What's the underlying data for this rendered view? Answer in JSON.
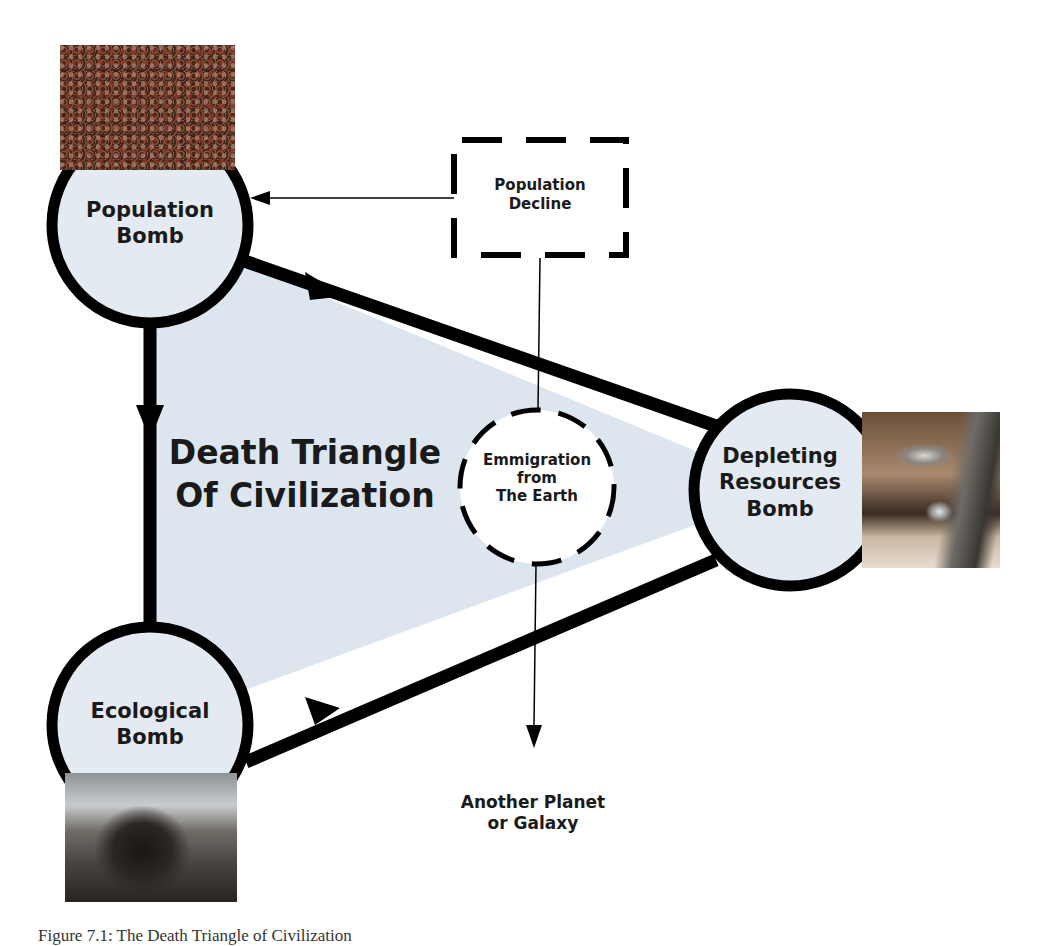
{
  "figure": {
    "title": "Death Triangle Of Civilization",
    "title_lines": [
      "Death Triangle",
      "Of Civilization"
    ],
    "caption": "Figure 7.1: The Death Triangle of Civilization",
    "colors": {
      "triangle_fill": "#dde6ef",
      "node_fill": "#e4eaf1",
      "stroke": "#000000",
      "background": "#ffffff"
    }
  },
  "nodes": {
    "population": {
      "lines": [
        "Population",
        "Bomb"
      ],
      "image": "crowd-photo"
    },
    "resources": {
      "lines": [
        "Depleting",
        "Resources",
        "Bomb"
      ],
      "image": "dripping-faucet-photo"
    },
    "ecological": {
      "lines": [
        "Ecological",
        "Bomb"
      ],
      "image": "oil-covered-bird-photo"
    }
  },
  "decline_box": {
    "lines": [
      "Population",
      "Decline"
    ],
    "style": "dashed"
  },
  "emigration": {
    "lines": [
      "Emmigration",
      "from",
      "The Earth"
    ],
    "style": "dashed"
  },
  "destination": {
    "lines": [
      "Another Planet",
      "or Galaxy"
    ]
  },
  "edges": [
    {
      "from": "population",
      "to": "resources",
      "type": "thick-arrow"
    },
    {
      "from": "population",
      "to": "ecological",
      "type": "thick-arrow"
    },
    {
      "from": "ecological",
      "to": "resources",
      "type": "thick-arrow"
    },
    {
      "from": "decline_box",
      "to": "population",
      "type": "thin-arrow"
    },
    {
      "from": "decline_box",
      "to": "emigration",
      "type": "thin-line"
    },
    {
      "from": "emigration",
      "to": "destination",
      "type": "thin-arrow"
    }
  ]
}
